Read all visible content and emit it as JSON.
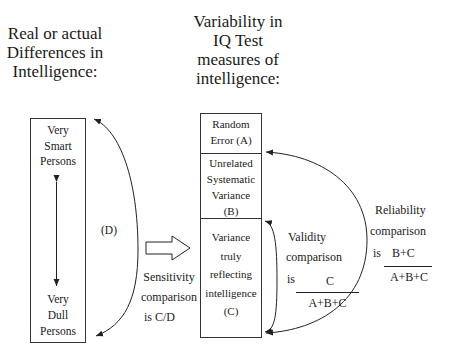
{
  "titles": {
    "left": [
      "Real or actual",
      "Differences in",
      "Intelligence:"
    ],
    "right": [
      "Variability in",
      "IQ Test",
      "measures of",
      "intelligence:"
    ]
  },
  "left_box": {
    "top_label": [
      "Very",
      "Smart",
      "Persons"
    ],
    "bottom_label": [
      "Very",
      "Dull",
      "Persons"
    ],
    "range_label": "(D)"
  },
  "right_box": {
    "segments": [
      {
        "id": "A",
        "lines": [
          "Random",
          "Error (A)"
        ]
      },
      {
        "id": "B",
        "lines": [
          "Unrelated",
          "Systematic",
          "Variance",
          "(B)"
        ]
      },
      {
        "id": "C",
        "lines": [
          "Variance",
          "truly",
          "reflecting",
          "intelligence",
          "(C)"
        ]
      }
    ]
  },
  "sensitivity": {
    "lines": [
      "Sensitivity",
      "comparison",
      "is C/D"
    ]
  },
  "validity": {
    "lines": [
      "Validity",
      "comparison"
    ],
    "is": "is",
    "numerator": "C",
    "denominator": "A+B+C"
  },
  "reliability": {
    "lines": [
      "Reliability",
      "comparison"
    ],
    "is": "is",
    "numerator": "B+C",
    "denominator": "A+B+C"
  },
  "colors": {
    "line": "#222222",
    "text": "#1a1a1a",
    "background": "#ffffff"
  }
}
